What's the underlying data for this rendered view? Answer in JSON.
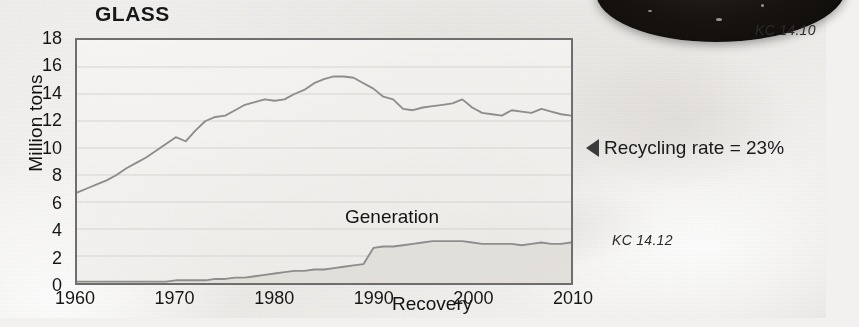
{
  "figure": {
    "title": "GLASS",
    "ylabel": "Million tons",
    "annotation": {
      "arrow_icon": "left-triangle-icon",
      "text": "Recycling rate = 23%"
    },
    "caption_top": "KC 14.10",
    "caption_bottom": "KC 14.12",
    "series_labels": {
      "generation": "Generation",
      "recovery": "Recovery"
    },
    "colors": {
      "line": "#8d8d8d",
      "axis": "#6e6e6e",
      "fill": "#e3e1de",
      "text": "#161616",
      "arrow": "#3b3b3b"
    }
  },
  "chart_data": {
    "type": "line",
    "title": "GLASS",
    "xlabel": "",
    "ylabel": "Million tons",
    "xlim": [
      1960,
      2010
    ],
    "ylim": [
      0,
      18
    ],
    "xticks": [
      1960,
      1970,
      1980,
      1990,
      2000,
      2010
    ],
    "yticks": [
      0,
      2,
      4,
      6,
      8,
      10,
      12,
      14,
      16,
      18
    ],
    "grid": true,
    "legend": "inline-labels",
    "annotations": [
      "Recycling rate = 23%",
      "KC 14.10",
      "KC 14.12"
    ],
    "x": [
      1960,
      1961,
      1962,
      1963,
      1964,
      1965,
      1966,
      1967,
      1968,
      1969,
      1970,
      1971,
      1972,
      1973,
      1974,
      1975,
      1976,
      1977,
      1978,
      1979,
      1980,
      1981,
      1982,
      1983,
      1984,
      1985,
      1986,
      1987,
      1988,
      1989,
      1990,
      1991,
      1992,
      1993,
      1994,
      1995,
      1996,
      1997,
      1998,
      1999,
      2000,
      2001,
      2002,
      2003,
      2004,
      2005,
      2006,
      2007,
      2008,
      2009,
      2010
    ],
    "series": [
      {
        "name": "Generation",
        "values": [
          6.7,
          7.0,
          7.3,
          7.6,
          8.0,
          8.5,
          8.9,
          9.3,
          9.8,
          10.3,
          10.8,
          10.5,
          11.3,
          12.0,
          12.3,
          12.4,
          12.8,
          13.2,
          13.4,
          13.6,
          13.5,
          13.6,
          14.0,
          14.3,
          14.8,
          15.1,
          15.3,
          15.3,
          15.2,
          14.8,
          14.4,
          13.8,
          13.6,
          12.9,
          12.8,
          13.0,
          13.1,
          13.2,
          13.3,
          13.6,
          13.0,
          12.6,
          12.5,
          12.4,
          12.8,
          12.7,
          12.6,
          12.9,
          12.7,
          12.5,
          12.4
        ]
      },
      {
        "name": "Recovery",
        "values": [
          0.1,
          0.1,
          0.1,
          0.1,
          0.1,
          0.1,
          0.1,
          0.1,
          0.1,
          0.1,
          0.2,
          0.2,
          0.2,
          0.2,
          0.3,
          0.3,
          0.4,
          0.4,
          0.5,
          0.6,
          0.7,
          0.8,
          0.9,
          0.9,
          1.0,
          1.0,
          1.1,
          1.2,
          1.3,
          1.4,
          2.6,
          2.7,
          2.7,
          2.8,
          2.9,
          3.0,
          3.1,
          3.1,
          3.1,
          3.1,
          3.0,
          2.9,
          2.9,
          2.9,
          2.9,
          2.8,
          2.9,
          3.0,
          2.9,
          2.9,
          3.0
        ]
      }
    ]
  }
}
